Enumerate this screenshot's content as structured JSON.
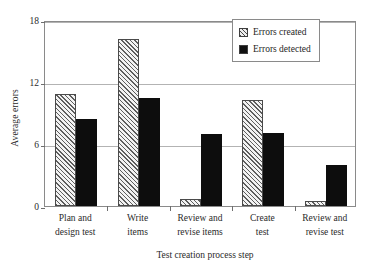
{
  "chart_data": {
    "type": "bar",
    "title": "",
    "xlabel": "Test creation process step",
    "ylabel": "Average errors",
    "categories": [
      "Plan and design test",
      "Write items",
      "Review and revise items",
      "Create test",
      "Review and revise test"
    ],
    "category_lines": [
      [
        "Plan and",
        "design test"
      ],
      [
        "Write",
        "items"
      ],
      [
        "Review and",
        "revise items"
      ],
      [
        "Create",
        "test"
      ],
      [
        "Review and",
        "revise test"
      ]
    ],
    "series": [
      {
        "name": "Errors created",
        "values": [
          10.8,
          16.2,
          0.7,
          10.3,
          0.5
        ]
      },
      {
        "name": "Errors detected",
        "values": [
          8.4,
          10.5,
          7.0,
          7.1,
          4.0
        ]
      }
    ],
    "ylim": [
      0,
      18
    ],
    "yticks": [
      0,
      6,
      12,
      18
    ],
    "ytick_labels": [
      "0",
      "6",
      "12",
      "18"
    ],
    "grid": "horizontal",
    "legend_position": "top-right",
    "legend": [
      "Errors created",
      "Errors detected"
    ],
    "colors": {
      "errors_created_fill": "#f2f2f2",
      "errors_created_hatch": "#5d5d5d",
      "errors_detected_fill": "#0d0d0d",
      "gridline": "#b3b3b3",
      "frame": "#8a8a8a",
      "text": "#2a2a2a"
    }
  }
}
